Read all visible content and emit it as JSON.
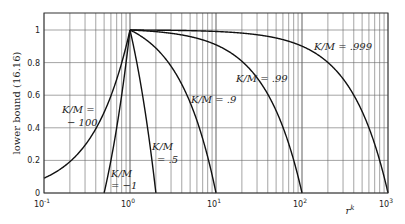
{
  "chart_data": {
    "type": "line",
    "title": "",
    "xlabel": "r^k",
    "ylabel": "lower bound (16.16)",
    "xscale": "log",
    "xlim": [
      0.1,
      1000
    ],
    "ylim": [
      0,
      1.1
    ],
    "grid": true,
    "x_ticks": [
      "10^-1",
      "10^0",
      "10^1",
      "10^2",
      "10^3"
    ],
    "y_ticks": [
      "0",
      "0.2",
      "0.4",
      "0.6",
      "0.8",
      "1"
    ],
    "formula": "lower bound = (1 - (1 - K/M) * r^k) / (K/M)",
    "series": [
      {
        "name": "K/M = -100",
        "c": -100,
        "label_lines": [
          "K/M =",
          "− 100"
        ],
        "points": [
          [
            0.1,
            0.091
          ],
          [
            0.2,
            0.192
          ],
          [
            0.3,
            0.293
          ],
          [
            0.5,
            0.495
          ],
          [
            0.7,
            0.697
          ],
          [
            1,
            1
          ]
        ]
      },
      {
        "name": "K/M = -1",
        "c": -1,
        "label_lines": [
          "K/M",
          "= −1"
        ],
        "points": [
          [
            0.5,
            0
          ],
          [
            0.75,
            0.5
          ],
          [
            1,
            1
          ]
        ]
      },
      {
        "name": "K/M = .5",
        "c": 0.5,
        "label_lines": [
          "K/M",
          "= .5"
        ],
        "points": [
          [
            1,
            1
          ],
          [
            1.5,
            0.5
          ],
          [
            2,
            0
          ]
        ]
      },
      {
        "name": "K/M = .9",
        "c": 0.9,
        "label_lines": [
          "K/M = .9"
        ],
        "points": [
          [
            1,
            1
          ],
          [
            2,
            0.889
          ],
          [
            5,
            0.556
          ],
          [
            8,
            0.222
          ],
          [
            10,
            0
          ]
        ]
      },
      {
        "name": "K/M = .99",
        "c": 0.99,
        "label_lines": [
          "K/M = .99"
        ],
        "points": [
          [
            1,
            1
          ],
          [
            10,
            0.909
          ],
          [
            50,
            0.505
          ],
          [
            80,
            0.202
          ],
          [
            100,
            0
          ]
        ]
      },
      {
        "name": "K/M = .999",
        "c": 0.999,
        "label_lines": [
          "K/M = .999"
        ],
        "points": [
          [
            1,
            1
          ],
          [
            10,
            0.991
          ],
          [
            100,
            0.901
          ],
          [
            500,
            0.5
          ],
          [
            1000,
            0
          ]
        ]
      }
    ]
  }
}
